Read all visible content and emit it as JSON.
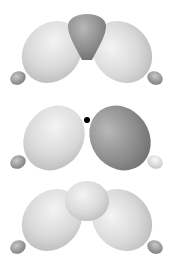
{
  "figure": {
    "orbitals": [
      {
        "id": "top",
        "lobes": [
          {
            "role": "left-lobe",
            "shade": "light"
          },
          {
            "role": "center-lobe",
            "shade": "dark"
          },
          {
            "role": "right-lobe",
            "shade": "light"
          },
          {
            "role": "left-small-lobe",
            "shade": "dark"
          },
          {
            "role": "right-small-lobe",
            "shade": "dark"
          }
        ]
      },
      {
        "id": "middle",
        "node_marker": true,
        "lobes": [
          {
            "role": "left-lobe",
            "shade": "light"
          },
          {
            "role": "right-lobe",
            "shade": "dark"
          },
          {
            "role": "left-small-lobe",
            "shade": "dark"
          },
          {
            "role": "right-small-lobe",
            "shade": "light"
          }
        ]
      },
      {
        "id": "bottom",
        "lobes": [
          {
            "role": "left-lobe",
            "shade": "light"
          },
          {
            "role": "center-lobe",
            "shade": "light"
          },
          {
            "role": "right-lobe",
            "shade": "light"
          },
          {
            "role": "left-small-lobe",
            "shade": "dark"
          },
          {
            "role": "right-small-lobe",
            "shade": "dark"
          }
        ]
      }
    ],
    "colors": {
      "light_hi": "#f2f2f2",
      "light_lo": "#bdbdbd",
      "dark_hi": "#b5b5b5",
      "dark_lo": "#6e6e6e",
      "node": "#000000",
      "background": "#ffffff"
    }
  }
}
